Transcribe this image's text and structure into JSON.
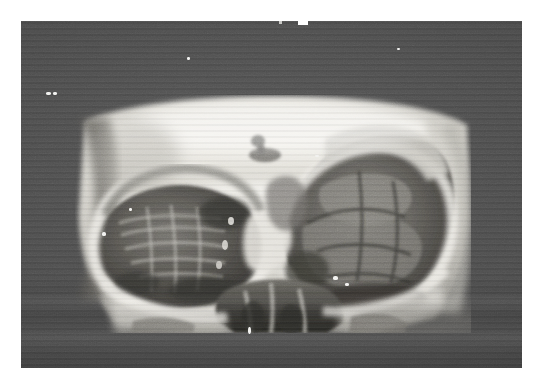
{
  "document": {
    "type": "photographic-reproduction",
    "subject": "three-dimensional computed tomography reconstruction of the craniofacial skeleton",
    "view": "frontal (anteroposterior) view of the midface showing both orbits, nasal aperture and maxillae",
    "modality": "CT 3D surface rendering photographed on film",
    "color_mode": "grayscale",
    "caption": "",
    "label": "",
    "visible_text": []
  },
  "canvas": {
    "width_px": 539,
    "height_px": 382,
    "page_background": "#ffffff"
  },
  "photo_frame": {
    "x": 21,
    "y": 21,
    "width": 501,
    "height": 347,
    "background_color": "#494949",
    "description": "dark gray photographic field surrounding the bright rendered skull",
    "has_horizontal_scan_banding": true
  },
  "image_region": {
    "x": 54,
    "y": 74,
    "width": 396,
    "height": 238,
    "description": "bright rendered bone surface of the midface"
  },
  "anatomy": [
    {
      "name": "frontal-bone",
      "region": "superior-central",
      "brightness": "bright",
      "note": "smooth broad forehead surface forming the upper half of the render"
    },
    {
      "name": "left-orbit",
      "region": "viewer-left",
      "brightness": "dark",
      "note": "large dark oval orbital cavity with striated internal bone detail"
    },
    {
      "name": "right-orbit",
      "region": "viewer-right",
      "brightness": "dark",
      "note": "enlarged irregular orbital defect with destroyed superior and lateral walls"
    },
    {
      "name": "supraorbital-rim-left",
      "region": "viewer-left-upper",
      "brightness": "bright"
    },
    {
      "name": "supraorbital-rim-right",
      "region": "viewer-right-upper",
      "brightness": "bright"
    },
    {
      "name": "nasal-aperture",
      "region": "inferior-central",
      "brightness": "dark",
      "note": "piriform aperture with nasal septum and turbinates"
    },
    {
      "name": "nasal-bridge",
      "region": "central",
      "brightness": "bright"
    },
    {
      "name": "maxilla",
      "region": "inferior",
      "brightness": "mixed"
    },
    {
      "name": "zygomatic-arch-left",
      "region": "lateral-left",
      "brightness": "bright"
    },
    {
      "name": "zygomatic-arch-right",
      "region": "lateral-right",
      "brightness": "bright"
    },
    {
      "name": "temporal-shadow-left",
      "region": "far-left",
      "brightness": "dark",
      "note": "vertical dark band lateral to the left orbit"
    },
    {
      "name": "lesion-marker",
      "region": "superior-central",
      "brightness": "dark",
      "note": "small dark irregular focus on the frontal bone"
    }
  ],
  "artifacts": {
    "film_specks": [
      {
        "x": 46,
        "y": 92,
        "w": 5,
        "h": 3
      },
      {
        "x": 53,
        "y": 92,
        "w": 4,
        "h": 3
      },
      {
        "x": 187,
        "y": 57,
        "w": 3,
        "h": 3
      },
      {
        "x": 397,
        "y": 48,
        "w": 3,
        "h": 2
      },
      {
        "x": 248,
        "y": 327,
        "w": 3,
        "h": 7
      },
      {
        "x": 129,
        "y": 208,
        "w": 3,
        "h": 3
      },
      {
        "x": 102,
        "y": 232,
        "w": 4,
        "h": 4
      },
      {
        "x": 315,
        "y": 155,
        "w": 4,
        "h": 2
      },
      {
        "x": 333,
        "y": 276,
        "w": 5,
        "h": 4
      },
      {
        "x": 345,
        "y": 283,
        "w": 4,
        "h": 3
      }
    ],
    "top_edge_notch": {
      "x": 298,
      "y": 21,
      "w": 10,
      "h": 4
    },
    "grain": true,
    "scan_lines": true
  },
  "palette": {
    "paper_white": "#ffffff",
    "frame_gray": "#494949",
    "frame_gray_dark": "#3c3c3c",
    "bone_bright": "#f0efea",
    "bone_mid": "#c8c6bf",
    "bone_shadow": "#8b8984",
    "cavity_dark": "#3a3936",
    "cavity_black": "#24231f",
    "speck_white": "#f2f2f0"
  }
}
